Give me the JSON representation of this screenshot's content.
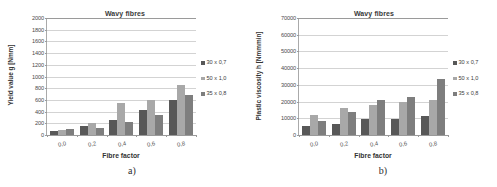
{
  "figure": {
    "panels": [
      {
        "caption": "a)",
        "title": "Wavy fibres",
        "ylabel": "Yield value g [Nmm]",
        "xlabel": "Fibre factor"
      },
      {
        "caption": "b)",
        "title": "Wavy fibres",
        "ylabel": "Plastic viscosity h [Nmmmin]",
        "xlabel": "Fibre factor"
      }
    ]
  },
  "colors": {
    "series_30x07": "#585858",
    "series_50x10": "#a8a8a8",
    "series_35x08": "#7e7e7e",
    "gridline": "#d3d3d3",
    "axis": "#9a9a9a",
    "background": "#ffffff"
  },
  "chart_data": [
    {
      "type": "bar",
      "title": "Wavy fibres",
      "xlabel": "Fibre factor",
      "ylabel": "Yield value g [Nmm]",
      "categories": [
        "0,0",
        "0,2",
        "0,4",
        "0,6",
        "0,8"
      ],
      "series": [
        {
          "name": "30 x 0,7",
          "values": [
            75,
            150,
            260,
            425,
            605
          ]
        },
        {
          "name": "50 x 1,0",
          "values": [
            90,
            210,
            555,
            595,
            850
          ]
        },
        {
          "name": "35 x 0,8",
          "values": [
            100,
            115,
            220,
            350,
            680
          ]
        }
      ],
      "ylim": [
        0,
        2000
      ],
      "yticks": [
        0,
        200,
        400,
        600,
        800,
        1000,
        1200,
        1400,
        1600,
        1800,
        2000
      ],
      "grid": true,
      "legend_position": "right"
    },
    {
      "type": "bar",
      "title": "Wavy fibres",
      "xlabel": "Fibre factor",
      "ylabel": "Plastic viscosity h [Nmmmin]",
      "categories": [
        "0,0",
        "0,2",
        "0,4",
        "0,6",
        "0,8"
      ],
      "series": [
        {
          "name": "30 x 0,7",
          "values": [
            5500,
            6300,
            9800,
            9300,
            11200
          ]
        },
        {
          "name": "50 x 1,0",
          "values": [
            11800,
            16200,
            18200,
            19800,
            21000
          ]
        },
        {
          "name": "35 x 0,8",
          "values": [
            8100,
            13700,
            20900,
            22600,
            33400
          ]
        }
      ],
      "ylim": [
        0,
        70000
      ],
      "yticks": [
        0,
        10000,
        20000,
        30000,
        40000,
        50000,
        60000,
        70000
      ],
      "grid": true,
      "legend_position": "right"
    }
  ]
}
